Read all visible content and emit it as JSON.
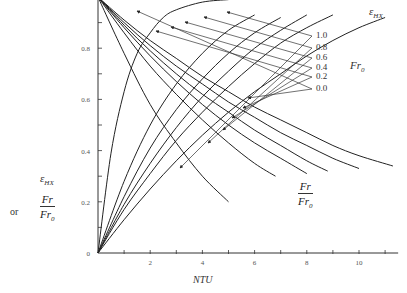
{
  "chart_data": {
    "type": "line",
    "title": "",
    "xlabel": "NTU",
    "ylabel": "ε_HX or Fr/Fr₀",
    "ylabel_parts": {
      "top": "ε",
      "top_sub": "HX",
      "or": "or",
      "num": "Fr",
      "den": "Fr",
      "den_sub": "0"
    },
    "xlim": [
      0,
      11.5
    ],
    "ylim": [
      0,
      1.0
    ],
    "x_ticks": [
      1,
      2,
      3,
      4,
      5,
      6,
      7,
      8,
      9,
      10,
      11
    ],
    "x_tick_labels": [
      {
        "v": 2,
        "t": "2"
      },
      {
        "v": 4,
        "t": "4"
      },
      {
        "v": 6,
        "t": "6"
      },
      {
        "v": 8,
        "t": "8"
      },
      {
        "v": 10,
        "t": "10"
      }
    ],
    "y_ticks": [
      0.1,
      0.2,
      0.3,
      0.4,
      0.5,
      0.6,
      0.7,
      0.8,
      0.9
    ],
    "y_tick_labels": [
      {
        "v": 0,
        "t": "0"
      },
      {
        "v": 0.2,
        "t": "0.2"
      },
      {
        "v": 0.4,
        "t": "0.4"
      },
      {
        "v": 0.6,
        "t": "0.6"
      },
      {
        "v": 0.8,
        "t": "0.8"
      }
    ],
    "grid": false,
    "legend": {
      "title": "Fr₀",
      "title_main": "Fr",
      "title_sub": "0",
      "position": "right",
      "entries": [
        "1.0",
        "0.8",
        "0.6",
        "0.4",
        "0.2",
        "0.0"
      ]
    },
    "annotations": {
      "effectiveness_label": "ε",
      "effectiveness_sub": "HX",
      "ratio_num": "Fr",
      "ratio_den": "Fr",
      "ratio_den_sub": "0"
    },
    "series_effectiveness": [
      {
        "name": "ε_HX, Fr₀=0.0",
        "x": [
          0,
          0.5,
          1,
          1.5,
          2,
          2.5,
          3,
          4,
          5
        ],
        "values": [
          0,
          0.39,
          0.63,
          0.78,
          0.86,
          0.92,
          0.95,
          0.98,
          0.99
        ]
      },
      {
        "name": "ε_HX, Fr₀=0.2",
        "x": [
          0,
          1,
          2,
          3,
          4,
          5,
          6
        ],
        "values": [
          0,
          0.28,
          0.5,
          0.66,
          0.78,
          0.87,
          0.93
        ]
      },
      {
        "name": "ε_HX, Fr₀=0.4",
        "x": [
          0,
          1,
          2,
          3,
          4,
          5,
          6,
          7
        ],
        "values": [
          0,
          0.22,
          0.41,
          0.56,
          0.68,
          0.78,
          0.86,
          0.92
        ]
      },
      {
        "name": "ε_HX, Fr₀=0.6",
        "x": [
          0,
          1,
          2,
          3,
          4,
          5,
          6,
          7,
          8
        ],
        "values": [
          0,
          0.19,
          0.35,
          0.49,
          0.61,
          0.71,
          0.8,
          0.87,
          0.93
        ]
      },
      {
        "name": "ε_HX, Fr₀=0.8",
        "x": [
          0,
          1,
          2,
          3,
          4,
          5,
          6,
          7,
          8,
          9
        ],
        "values": [
          0,
          0.17,
          0.31,
          0.44,
          0.55,
          0.65,
          0.74,
          0.82,
          0.88,
          0.93
        ]
      },
      {
        "name": "ε_HX, Fr₀=1.0",
        "x": [
          0,
          1,
          2,
          3,
          4,
          5,
          6,
          7,
          8,
          9,
          10,
          11
        ],
        "values": [
          0,
          0.13,
          0.25,
          0.36,
          0.46,
          0.55,
          0.63,
          0.7,
          0.77,
          0.83,
          0.88,
          0.92
        ]
      }
    ],
    "series_ratio": [
      {
        "name": "Fr/Fr₀, Fr₀=0.0",
        "x": [
          0,
          1,
          2,
          3,
          4,
          5
        ],
        "values": [
          1.0,
          0.78,
          0.58,
          0.43,
          0.3,
          0.2
        ]
      },
      {
        "name": "Fr/Fr₀, Fr₀=0.2",
        "x": [
          0,
          1,
          2,
          3,
          4,
          5,
          6,
          6.8
        ],
        "values": [
          1.0,
          0.86,
          0.73,
          0.62,
          0.52,
          0.43,
          0.35,
          0.3
        ]
      },
      {
        "name": "Fr/Fr₀, Fr₀=0.4",
        "x": [
          0,
          1,
          2,
          3,
          4,
          5,
          6,
          7,
          8
        ],
        "values": [
          1.0,
          0.88,
          0.77,
          0.67,
          0.58,
          0.5,
          0.43,
          0.37,
          0.31
        ]
      },
      {
        "name": "Fr/Fr₀, Fr₀=0.6",
        "x": [
          0,
          1,
          2,
          3,
          4,
          5,
          6,
          7,
          8,
          8.8
        ],
        "values": [
          1.0,
          0.89,
          0.79,
          0.7,
          0.62,
          0.55,
          0.48,
          0.42,
          0.36,
          0.32
        ]
      },
      {
        "name": "Fr/Fr₀, Fr₀=0.8",
        "x": [
          0,
          1,
          2,
          3,
          4,
          5,
          6,
          7,
          8,
          9,
          10
        ],
        "values": [
          1.0,
          0.9,
          0.81,
          0.73,
          0.66,
          0.59,
          0.53,
          0.47,
          0.42,
          0.37,
          0.33
        ]
      },
      {
        "name": "Fr/Fr₀, Fr₀=1.0",
        "x": [
          0,
          1,
          2,
          3,
          4,
          5,
          6,
          7,
          8,
          9,
          10,
          11.3
        ],
        "values": [
          1.0,
          0.91,
          0.83,
          0.76,
          0.69,
          0.63,
          0.57,
          0.52,
          0.47,
          0.42,
          0.38,
          0.34
        ]
      }
    ],
    "leader_lines": [
      {
        "label": "1.0",
        "from": [
          280,
          36
        ],
        "to_eff": [
          227,
          12
        ],
        "to_ratio": [
          180,
          168
        ]
      },
      {
        "label": "0.8",
        "from": [
          280,
          48
        ],
        "to_eff": [
          204,
          17
        ],
        "to_ratio": [
          208,
          143
        ]
      },
      {
        "label": "0.6",
        "from": [
          280,
          58
        ],
        "to_eff": [
          185,
          22
        ],
        "to_ratio": [
          223,
          130
        ]
      },
      {
        "label": "0.4",
        "from": [
          280,
          68
        ],
        "to_eff": [
          171,
          27
        ],
        "to_ratio": [
          232,
          118
        ]
      },
      {
        "label": "0.2",
        "from": [
          280,
          77
        ],
        "to_eff": [
          156,
          31
        ],
        "to_ratio": [
          243,
          108
        ]
      },
      {
        "label": "0.0",
        "from": [
          280,
          89
        ],
        "to_eff": [
          137,
          11
        ],
        "to_ratio": [
          248,
          98
        ]
      }
    ]
  },
  "labels": {
    "legend_values": [
      "1.0",
      "0.8",
      "0.6",
      "0.4",
      "0.2",
      "0.0"
    ]
  }
}
